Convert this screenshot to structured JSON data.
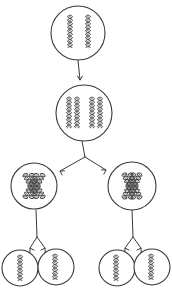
{
  "diagram": {
    "type": "cell-division-meiosis-sketch",
    "stroke_color": "#3a3a3a",
    "background": "#ffffff",
    "cells": [
      {
        "id": "parent-cell",
        "cx": 78,
        "cy": 33,
        "r": 27,
        "chromosomes": [
          {
            "x": 70,
            "y1": 15,
            "y2": 48,
            "angle": 0
          },
          {
            "x": 88,
            "y1": 15,
            "y2": 48,
            "angle": 0
          }
        ],
        "chromosome_style": "single"
      },
      {
        "id": "replicated-cell",
        "cx": 84,
        "cy": 113,
        "r": 28,
        "chromosomes": [
          {
            "x": 69,
            "y1": 97,
            "y2": 128,
            "angle": 0
          },
          {
            "x": 77,
            "y1": 97,
            "y2": 128,
            "angle": 0
          },
          {
            "x": 92,
            "y1": 97,
            "y2": 128,
            "angle": 0
          },
          {
            "x": 100,
            "y1": 97,
            "y2": 128,
            "angle": 0
          }
        ],
        "chromosome_style": "single"
      },
      {
        "id": "meiosis-i-left",
        "cx": 34,
        "cy": 186,
        "r": 23,
        "chromosomes": [
          {
            "x": 34,
            "y1": 172,
            "y2": 200,
            "angle": -28
          },
          {
            "x": 34,
            "y1": 172,
            "y2": 200,
            "angle": 28
          }
        ],
        "chromosome_style": "crossed"
      },
      {
        "id": "meiosis-i-right",
        "cx": 132,
        "cy": 186,
        "r": 24,
        "chromosomes": [
          {
            "x": 132,
            "y1": 172,
            "y2": 200,
            "angle": -22
          },
          {
            "x": 132,
            "y1": 172,
            "y2": 200,
            "angle": 22
          }
        ],
        "chromosome_style": "crossed"
      },
      {
        "id": "gamete-1",
        "cx": 20,
        "cy": 268,
        "r": 18,
        "chromosomes": [
          {
            "x": 20,
            "y1": 255,
            "y2": 281,
            "angle": 0
          }
        ],
        "chromosome_style": "single"
      },
      {
        "id": "gamete-2",
        "cx": 56,
        "cy": 267,
        "r": 18,
        "chromosomes": [
          {
            "x": 55,
            "y1": 254,
            "y2": 280,
            "angle": 0
          }
        ],
        "chromosome_style": "single"
      },
      {
        "id": "gamete-3",
        "cx": 117,
        "cy": 268,
        "r": 18,
        "chromosomes": [
          {
            "x": 116,
            "y1": 255,
            "y2": 281,
            "angle": 0
          }
        ],
        "chromosome_style": "single"
      },
      {
        "id": "gamete-4",
        "cx": 152,
        "cy": 267,
        "r": 18,
        "chromosomes": [
          {
            "x": 151,
            "y1": 254,
            "y2": 280,
            "angle": 0
          }
        ],
        "chromosome_style": "single"
      }
    ],
    "arrows": [
      {
        "id": "arrow-replication",
        "path": "M78,60 L80,80",
        "heads": [
          [
            80,
            80,
            -90
          ]
        ]
      },
      {
        "id": "arrow-meiosis-i",
        "path": "M82,141 L85,157 M85,157 L60,171 M85,157 L106,170",
        "heads": [
          [
            60,
            171,
            150
          ],
          [
            106,
            170,
            30
          ]
        ]
      },
      {
        "id": "arrow-meiosis-ii-left",
        "path": "M36,210 L37,237 M37,237 L30,248 M37,237 L45,248",
        "heads": [
          [
            30,
            248,
            120
          ],
          [
            45,
            248,
            60
          ]
        ]
      },
      {
        "id": "arrow-meiosis-ii-right",
        "path": "M132,210 L133,237 M133,237 L125,248 M133,237 L141,248",
        "heads": [
          [
            125,
            248,
            120
          ],
          [
            141,
            248,
            60
          ]
        ]
      }
    ]
  }
}
